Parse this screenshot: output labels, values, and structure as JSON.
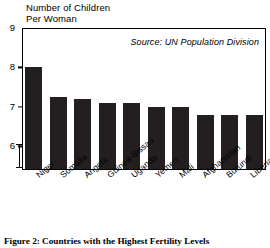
{
  "chart_data": {
    "type": "bar",
    "title": "Number of Children\nPer Woman",
    "xlabel": "",
    "ylabel": "Number of Children Per Woman",
    "categories": [
      "Niger",
      "Somalia",
      "Angola",
      "Guinea-Bissau",
      "Uganda",
      "Yemen",
      "Mali",
      "Afghanistan",
      "Burundi",
      "Liberia"
    ],
    "values": [
      8.0,
      7.25,
      7.2,
      7.1,
      7.1,
      7.0,
      7.0,
      6.8,
      6.8,
      6.8
    ],
    "ylim": [
      5.4,
      9
    ],
    "yticks": [
      9,
      8,
      7,
      6
    ],
    "ytick_labels": [
      "9",
      "8",
      "7",
      "6"
    ],
    "axis_break": true,
    "grid": false,
    "legend": false,
    "annotations": [
      "Source: UN Population Division"
    ],
    "bar_color": "#231f20"
  },
  "figure": {
    "axis_title": "Number of Children\nPer Woman",
    "source_note": "Source: UN Population Division",
    "caption": "Figure 2: Countries with the Highest Fertility Levels"
  }
}
